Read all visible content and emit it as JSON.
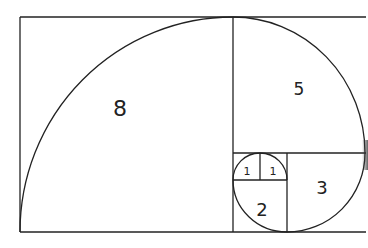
{
  "diagram": {
    "title": "",
    "type": "fibonacci-spiral",
    "squares": [
      {
        "id": "sq-8",
        "label": "8",
        "x": 20,
        "y": 17,
        "w": 213,
        "h": 215
      },
      {
        "id": "sq-5",
        "label": "5",
        "x": 233,
        "y": 17,
        "w": 132,
        "h": 136
      },
      {
        "id": "sq-3",
        "label": "3",
        "x": 287,
        "y": 153,
        "w": 78,
        "h": 79
      },
      {
        "id": "sq-2",
        "label": "2",
        "x": 233,
        "y": 180,
        "w": 54,
        "h": 52
      },
      {
        "id": "sq-1a",
        "label": "1",
        "x": 233,
        "y": 153,
        "w": 27,
        "h": 27
      },
      {
        "id": "sq-1b",
        "label": "1",
        "x": 260,
        "y": 153,
        "w": 27,
        "h": 27
      }
    ],
    "labels": {
      "eight": "8",
      "five": "5",
      "three": "3",
      "two": "2",
      "one_a": "1",
      "one_b": "1"
    },
    "colors": {
      "line": "#222222",
      "background": "#ffffff"
    }
  }
}
